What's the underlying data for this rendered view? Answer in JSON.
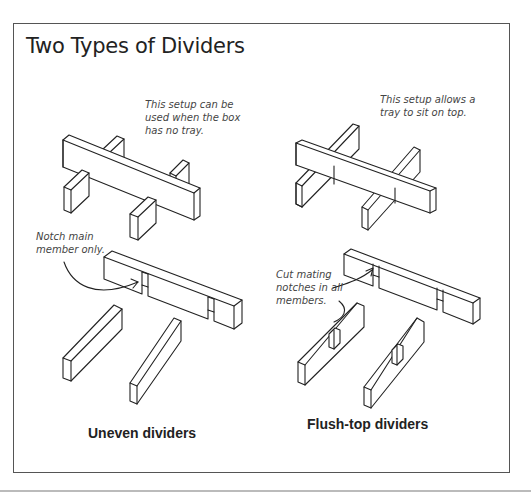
{
  "title": "Two Types of Dividers",
  "panels": [
    {
      "id": "uneven",
      "caption": "Uneven dividers",
      "note_assembled": [
        "This setup can be",
        "used when the box",
        "has no tray."
      ],
      "note_parts": [
        "Notch main",
        "member only."
      ]
    },
    {
      "id": "flush",
      "caption": "Flush-top dividers",
      "note_assembled": [
        "This setup allows a",
        "tray to sit on top."
      ],
      "note_parts": [
        "Cut mating",
        "notches in all",
        "members."
      ]
    }
  ],
  "colors": {
    "ink": "#222222",
    "frame": "#555555",
    "note": "#444444",
    "background": "#ffffff"
  }
}
